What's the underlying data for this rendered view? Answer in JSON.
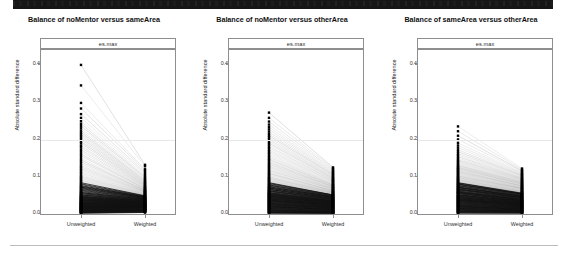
{
  "header_band": {
    "present": true,
    "description": "dark-cropped-header-strip",
    "color": "#161616"
  },
  "figure": {
    "axis": {
      "y_label": "Absolute standard difference",
      "y_ticks": [
        "0.0",
        "0.1",
        "0.2",
        "0.3",
        "0.4"
      ],
      "y_tick_values": [
        0.0,
        0.1,
        0.2,
        0.3,
        0.4
      ],
      "x_ticks": [
        "Unweighted",
        "Weighted"
      ],
      "reference_line": 0.2,
      "strip_label": "es.max"
    },
    "separator_color": "#bdbdbd"
  },
  "chart_data": {
    "type": "line",
    "title": "Balance of noMentor versus sameArea",
    "xlabel": "",
    "ylabel": "Absolute standard difference",
    "x": [
      "Unweighted",
      "Weighted"
    ],
    "ylim": [
      0.0,
      0.44
    ],
    "grid": false,
    "legend": "none",
    "annotations": [
      "es.max reference line at 0.2"
    ],
    "panels": [
      {
        "title": "Balance of noMentor versus sameArea",
        "strip_label": "es.max",
        "categories": [
          "Unweighted",
          "Weighted"
        ],
        "ylim": [
          0.0,
          0.44
        ],
        "reference_line": 0.2,
        "n_pairs": 120,
        "unweighted_max": 0.4,
        "unweighted_median": 0.035,
        "weighted_max": 0.135,
        "weighted_median": 0.03,
        "series": [
          {
            "name": "unweighted",
            "values": [
              0.4,
              0.345,
              0.298,
              0.283,
              0.268,
              0.258,
              0.249,
              0.242,
              0.236,
              0.23,
              0.224,
              0.219,
              0.214,
              0.209,
              0.204,
              0.199,
              0.194,
              0.189,
              0.183,
              0.178,
              0.172,
              0.167,
              0.161,
              0.156,
              0.15,
              0.145,
              0.14,
              0.135,
              0.13,
              0.126,
              0.122,
              0.118,
              0.114,
              0.11,
              0.106,
              0.102,
              0.099,
              0.096,
              0.093,
              0.09,
              0.087,
              0.084,
              0.081,
              0.079,
              0.076,
              0.074,
              0.072,
              0.07,
              0.068,
              0.066,
              0.064,
              0.062,
              0.06,
              0.058,
              0.057,
              0.055,
              0.054,
              0.052,
              0.051,
              0.05,
              0.048,
              0.047,
              0.046,
              0.045,
              0.044,
              0.043,
              0.042,
              0.041,
              0.04,
              0.039,
              0.038,
              0.037,
              0.036,
              0.035,
              0.034,
              0.033,
              0.032,
              0.032,
              0.031,
              0.03,
              0.029,
              0.028,
              0.028,
              0.027,
              0.026,
              0.025,
              0.025,
              0.024,
              0.023,
              0.022,
              0.022,
              0.021,
              0.02,
              0.02,
              0.019,
              0.018,
              0.018,
              0.017,
              0.016,
              0.016,
              0.015,
              0.014,
              0.014,
              0.013,
              0.012,
              0.012,
              0.011,
              0.01,
              0.01,
              0.009,
              0.008,
              0.008,
              0.007,
              0.006,
              0.006,
              0.005,
              0.004,
              0.004,
              0.003,
              0.002
            ]
          },
          {
            "name": "weighted",
            "values": [
              0.132,
              0.128,
              0.12,
              0.117,
              0.112,
              0.108,
              0.104,
              0.1,
              0.097,
              0.094,
              0.091,
              0.089,
              0.086,
              0.084,
              0.082,
              0.08,
              0.078,
              0.076,
              0.074,
              0.073,
              0.071,
              0.07,
              0.068,
              0.067,
              0.066,
              0.064,
              0.063,
              0.062,
              0.061,
              0.06,
              0.059,
              0.058,
              0.057,
              0.056,
              0.055,
              0.054,
              0.053,
              0.052,
              0.051,
              0.05,
              0.049,
              0.049,
              0.048,
              0.047,
              0.046,
              0.046,
              0.045,
              0.044,
              0.044,
              0.043,
              0.042,
              0.042,
              0.041,
              0.04,
              0.04,
              0.039,
              0.038,
              0.038,
              0.037,
              0.036,
              0.036,
              0.035,
              0.035,
              0.034,
              0.033,
              0.033,
              0.032,
              0.032,
              0.031,
              0.031,
              0.03,
              0.03,
              0.029,
              0.029,
              0.028,
              0.028,
              0.027,
              0.027,
              0.026,
              0.026,
              0.025,
              0.025,
              0.024,
              0.024,
              0.023,
              0.023,
              0.022,
              0.022,
              0.021,
              0.021,
              0.02,
              0.02,
              0.019,
              0.019,
              0.018,
              0.018,
              0.017,
              0.017,
              0.016,
              0.016,
              0.015,
              0.015,
              0.014,
              0.014,
              0.013,
              0.013,
              0.012,
              0.012,
              0.011,
              0.011,
              0.01,
              0.01,
              0.009,
              0.008,
              0.008,
              0.007,
              0.006,
              0.006,
              0.005,
              0.004
            ]
          }
        ]
      },
      {
        "title": "Balance of noMentor versus otherArea",
        "strip_label": "es.max",
        "categories": [
          "Unweighted",
          "Weighted"
        ],
        "ylim": [
          0.0,
          0.44
        ],
        "reference_line": 0.2,
        "n_pairs": 120,
        "unweighted_max": 0.272,
        "unweighted_median": 0.055,
        "weighted_max": 0.125,
        "weighted_median": 0.045,
        "series": [
          {
            "name": "unweighted",
            "values": [
              0.272,
              0.258,
              0.248,
              0.24,
              0.233,
              0.227,
              0.221,
              0.215,
              0.21,
              0.205,
              0.2,
              0.195,
              0.19,
              0.186,
              0.181,
              0.177,
              0.172,
              0.168,
              0.164,
              0.16,
              0.156,
              0.152,
              0.148,
              0.145,
              0.141,
              0.138,
              0.134,
              0.131,
              0.128,
              0.125,
              0.122,
              0.119,
              0.116,
              0.113,
              0.11,
              0.108,
              0.105,
              0.103,
              0.1,
              0.098,
              0.096,
              0.094,
              0.092,
              0.09,
              0.088,
              0.086,
              0.084,
              0.082,
              0.08,
              0.078,
              0.077,
              0.075,
              0.073,
              0.072,
              0.07,
              0.069,
              0.067,
              0.066,
              0.065,
              0.063,
              0.062,
              0.061,
              0.06,
              0.058,
              0.057,
              0.056,
              0.055,
              0.054,
              0.053,
              0.052,
              0.051,
              0.05,
              0.049,
              0.048,
              0.047,
              0.046,
              0.045,
              0.044,
              0.043,
              0.042,
              0.041,
              0.04,
              0.039,
              0.038,
              0.037,
              0.036,
              0.035,
              0.034,
              0.033,
              0.032,
              0.031,
              0.03,
              0.029,
              0.028,
              0.027,
              0.026,
              0.025,
              0.024,
              0.023,
              0.022,
              0.021,
              0.02,
              0.019,
              0.018,
              0.017,
              0.016,
              0.015,
              0.014,
              0.013,
              0.012,
              0.011,
              0.01,
              0.009,
              0.008,
              0.007,
              0.006,
              0.005,
              0.004,
              0.003,
              0.002
            ]
          },
          {
            "name": "weighted",
            "values": [
              0.125,
              0.122,
              0.119,
              0.116,
              0.113,
              0.111,
              0.108,
              0.106,
              0.104,
              0.101,
              0.099,
              0.097,
              0.095,
              0.093,
              0.091,
              0.09,
              0.088,
              0.086,
              0.085,
              0.083,
              0.081,
              0.08,
              0.078,
              0.077,
              0.076,
              0.074,
              0.073,
              0.072,
              0.07,
              0.069,
              0.068,
              0.067,
              0.066,
              0.064,
              0.063,
              0.062,
              0.061,
              0.06,
              0.059,
              0.058,
              0.057,
              0.056,
              0.055,
              0.054,
              0.053,
              0.052,
              0.051,
              0.051,
              0.05,
              0.049,
              0.048,
              0.047,
              0.046,
              0.046,
              0.045,
              0.044,
              0.043,
              0.042,
              0.042,
              0.041,
              0.04,
              0.039,
              0.039,
              0.038,
              0.037,
              0.036,
              0.036,
              0.035,
              0.034,
              0.034,
              0.033,
              0.032,
              0.032,
              0.031,
              0.03,
              0.03,
              0.029,
              0.028,
              0.028,
              0.027,
              0.026,
              0.026,
              0.025,
              0.024,
              0.024,
              0.023,
              0.022,
              0.022,
              0.021,
              0.02,
              0.02,
              0.019,
              0.018,
              0.018,
              0.017,
              0.016,
              0.016,
              0.015,
              0.014,
              0.014,
              0.013,
              0.012,
              0.012,
              0.011,
              0.01,
              0.01,
              0.009,
              0.008,
              0.008,
              0.007,
              0.006,
              0.006,
              0.005,
              0.005,
              0.004,
              0.004,
              0.003,
              0.003,
              0.002,
              0.002
            ]
          }
        ]
      },
      {
        "title": "Balance of sameArea versus otherArea",
        "strip_label": "es.max",
        "categories": [
          "Unweighted",
          "Weighted"
        ],
        "ylim": [
          0.0,
          0.44
        ],
        "reference_line": 0.2,
        "n_pairs": 120,
        "unweighted_max": 0.235,
        "unweighted_median": 0.06,
        "weighted_max": 0.122,
        "weighted_median": 0.048,
        "series": [
          {
            "name": "unweighted",
            "values": [
              0.235,
              0.222,
              0.21,
              0.2,
              0.191,
              0.184,
              0.178,
              0.172,
              0.167,
              0.162,
              0.158,
              0.154,
              0.15,
              0.146,
              0.143,
              0.14,
              0.137,
              0.134,
              0.131,
              0.129,
              0.126,
              0.124,
              0.122,
              0.12,
              0.118,
              0.116,
              0.114,
              0.112,
              0.11,
              0.108,
              0.106,
              0.104,
              0.102,
              0.1,
              0.098,
              0.097,
              0.095,
              0.093,
              0.092,
              0.09,
              0.089,
              0.087,
              0.086,
              0.084,
              0.083,
              0.081,
              0.08,
              0.079,
              0.077,
              0.076,
              0.075,
              0.073,
              0.072,
              0.071,
              0.07,
              0.068,
              0.067,
              0.066,
              0.065,
              0.064,
              0.062,
              0.061,
              0.06,
              0.059,
              0.058,
              0.057,
              0.056,
              0.055,
              0.054,
              0.052,
              0.051,
              0.05,
              0.049,
              0.048,
              0.047,
              0.046,
              0.045,
              0.044,
              0.043,
              0.042,
              0.041,
              0.04,
              0.039,
              0.038,
              0.037,
              0.036,
              0.035,
              0.034,
              0.033,
              0.032,
              0.031,
              0.03,
              0.029,
              0.028,
              0.027,
              0.026,
              0.025,
              0.024,
              0.023,
              0.022,
              0.021,
              0.02,
              0.019,
              0.018,
              0.017,
              0.016,
              0.015,
              0.014,
              0.013,
              0.012,
              0.011,
              0.01,
              0.009,
              0.008,
              0.007,
              0.006,
              0.005,
              0.004,
              0.003,
              0.002
            ]
          },
          {
            "name": "weighted",
            "values": [
              0.122,
              0.119,
              0.116,
              0.114,
              0.111,
              0.109,
              0.107,
              0.105,
              0.103,
              0.101,
              0.099,
              0.097,
              0.095,
              0.094,
              0.092,
              0.09,
              0.089,
              0.087,
              0.086,
              0.084,
              0.083,
              0.081,
              0.08,
              0.079,
              0.077,
              0.076,
              0.075,
              0.074,
              0.072,
              0.071,
              0.07,
              0.069,
              0.068,
              0.067,
              0.066,
              0.064,
              0.063,
              0.062,
              0.061,
              0.06,
              0.059,
              0.058,
              0.057,
              0.056,
              0.055,
              0.054,
              0.054,
              0.053,
              0.052,
              0.051,
              0.05,
              0.049,
              0.048,
              0.047,
              0.047,
              0.046,
              0.045,
              0.044,
              0.043,
              0.043,
              0.042,
              0.041,
              0.04,
              0.039,
              0.039,
              0.038,
              0.037,
              0.036,
              0.036,
              0.035,
              0.034,
              0.034,
              0.033,
              0.032,
              0.032,
              0.031,
              0.03,
              0.03,
              0.029,
              0.028,
              0.028,
              0.027,
              0.026,
              0.026,
              0.025,
              0.024,
              0.024,
              0.023,
              0.022,
              0.022,
              0.021,
              0.02,
              0.02,
              0.019,
              0.019,
              0.018,
              0.017,
              0.017,
              0.016,
              0.015,
              0.015,
              0.014,
              0.013,
              0.013,
              0.012,
              0.011,
              0.011,
              0.01,
              0.009,
              0.009,
              0.008,
              0.007,
              0.007,
              0.006,
              0.005,
              0.005,
              0.004,
              0.003,
              0.003,
              0.002
            ]
          }
        ]
      }
    ]
  }
}
